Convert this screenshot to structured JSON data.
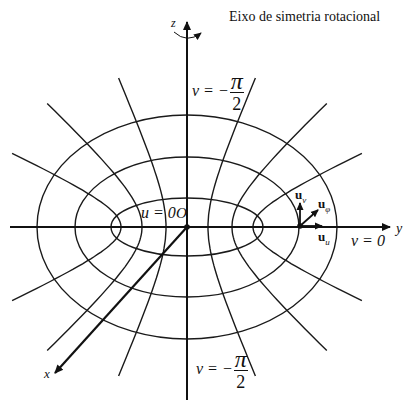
{
  "title": "Eixo de simetria rotacional",
  "axes": {
    "z": "z",
    "y": "y",
    "x": "x",
    "origin": "O"
  },
  "labels": {
    "u_zero": "u = 0",
    "v_zero": "v = 0",
    "v_top_prefix": "v = −",
    "v_top_num": "π",
    "v_top_den": "2",
    "v_bottom_prefix": "v = −",
    "v_bottom_num": "π",
    "v_bottom_den": "2"
  },
  "unit_vectors": {
    "u_v": {
      "base": "u",
      "sub": "v"
    },
    "u_phi": {
      "base": "u",
      "sub": "φ"
    },
    "u_u": {
      "base": "u",
      "sub": "u"
    }
  },
  "geometry": {
    "center": [
      187,
      227
    ],
    "ellipses": [
      {
        "rx": 76,
        "ry": 29
      },
      {
        "rx": 112,
        "ry": 70
      },
      {
        "rx": 150,
        "ry": 112
      }
    ],
    "hyperbolas": [
      {
        "a": 21,
        "b": 48,
        "tmax": 1.85
      },
      {
        "a": 45,
        "b": 42,
        "tmax": 1.8
      },
      {
        "a": 66,
        "b": 30,
        "tmax": 1.63
      }
    ],
    "line_color": "#1a1a1a"
  }
}
